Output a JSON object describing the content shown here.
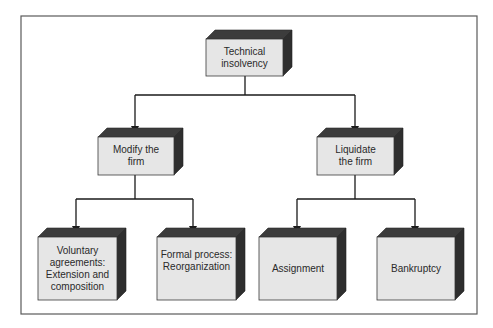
{
  "diagram": {
    "type": "tree",
    "root": {
      "id": "technical-insolvency",
      "label": "Technical insolvency",
      "lines": [
        "Technical",
        "insolvency"
      ]
    },
    "level2": [
      {
        "id": "modify-the-firm",
        "label": "Modify the firm",
        "lines": [
          "Modify the",
          "firm"
        ],
        "children": [
          {
            "id": "voluntary-agreements",
            "label": "Voluntary agreements: Extension and composition",
            "lines": [
              "Voluntary",
              "agreements:",
              "Extension and",
              "composition"
            ]
          },
          {
            "id": "formal-process",
            "label": "Formal process: Reorganization",
            "lines": [
              "Formal process:",
              "Reorganization"
            ]
          }
        ]
      },
      {
        "id": "liquidate-the-firm",
        "label": "Liquidate the firm",
        "lines": [
          "Liquidate",
          "the firm"
        ],
        "children": [
          {
            "id": "assignment",
            "label": "Assignment",
            "lines": [
              "Assignment"
            ]
          },
          {
            "id": "bankruptcy",
            "label": "Bankruptcy",
            "lines": [
              "Bankruptcy"
            ]
          }
        ]
      }
    ]
  },
  "colors": {
    "box_front": "#e6e6e6",
    "box_shadow": "#2e2e2e",
    "line": "#1a1a1a",
    "frame": "#5a5a5a"
  }
}
